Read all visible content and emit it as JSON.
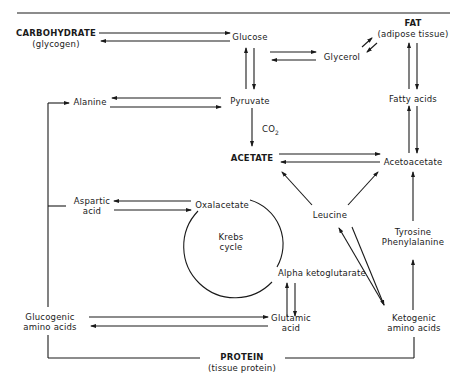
{
  "diagram": {
    "type": "metabolic-pathway",
    "nodes": {
      "carbohydrate": {
        "title": "CARBOHYDRATE",
        "subtitle": "(glycogen)"
      },
      "glucose": {
        "label": "Glucose"
      },
      "glycerol": {
        "label": "Glycerol"
      },
      "fat": {
        "title": "FAT",
        "subtitle": "(adipose tissue)"
      },
      "alanine": {
        "label": "Alanine"
      },
      "pyruvate": {
        "label": "Pyruvate"
      },
      "fatty_acids": {
        "label": "Fatty acids"
      },
      "co2": {
        "label": "CO",
        "sub": "2"
      },
      "acetate": {
        "label": "ACETATE"
      },
      "acetoacetate": {
        "label": "Acetoacetate"
      },
      "aspartic_acid": {
        "line1": "Aspartic",
        "line2": "acid"
      },
      "oxalacetate": {
        "label": "Oxalacetate"
      },
      "leucine": {
        "label": "Leucine"
      },
      "krebs_cycle": {
        "line1": "Krebs",
        "line2": "cycle"
      },
      "tyrosine_phenylalanine": {
        "line1": "Tyrosine",
        "line2": "Phenylalanine"
      },
      "alpha_ketoglutarate": {
        "label": "Alpha ketoglutarate"
      },
      "glucogenic_amino_acids": {
        "line1": "Glucogenic",
        "line2": "amino acids"
      },
      "glutamic_acid": {
        "line1": "Glutamic",
        "line2": "acid"
      },
      "ketogenic_amino_acids": {
        "line1": "Ketogenic",
        "line2": "amino acids"
      },
      "protein": {
        "title": "PROTEIN",
        "subtitle": "(tissue protein)"
      }
    },
    "edges": [
      {
        "from": "Carbohydrate",
        "to": "Glucose",
        "type": "reversible"
      },
      {
        "from": "Glucose",
        "to": "Glycerol",
        "type": "reversible"
      },
      {
        "from": "Glycerol",
        "to": "Fat",
        "type": "reversible"
      },
      {
        "from": "Glucose",
        "to": "Pyruvate",
        "type": "reversible"
      },
      {
        "from": "Fat",
        "to": "Fatty acids",
        "type": "reversible"
      },
      {
        "from": "Alanine",
        "to": "Pyruvate",
        "type": "reversible"
      },
      {
        "from": "Pyruvate",
        "to": "Acetate",
        "type": "one-way",
        "note": "CO2"
      },
      {
        "from": "Fatty acids",
        "to": "Acetoacetate",
        "type": "reversible"
      },
      {
        "from": "Acetate",
        "to": "Acetoacetate",
        "type": "reversible"
      },
      {
        "from": "Leucine",
        "to": "Acetate",
        "type": "one-way"
      },
      {
        "from": "Leucine",
        "to": "Acetoacetate",
        "type": "one-way"
      },
      {
        "from": "Aspartic acid",
        "to": "Oxalacetate",
        "type": "reversible"
      },
      {
        "from": "Tyrosine/Phenylalanine",
        "to": "Acetoacetate",
        "type": "one-way"
      },
      {
        "from": "Alpha ketoglutarate",
        "to": "Glutamic acid",
        "type": "reversible"
      },
      {
        "from": "Glucogenic amino acids",
        "to": "Glutamic acid",
        "type": "reversible"
      },
      {
        "from": "Leucine",
        "to": "Ketogenic amino acids",
        "type": "reversible"
      },
      {
        "from": "Ketogenic amino acids",
        "to": "Tyrosine/Phenylalanine",
        "type": "one-way"
      },
      {
        "from": "Protein",
        "to": "Glucogenic amino acids",
        "type": "line"
      },
      {
        "from": "Protein",
        "to": "Ketogenic amino acids",
        "type": "line"
      },
      {
        "from": "Glucogenic amino acids",
        "to": "Alanine",
        "type": "one-way"
      },
      {
        "from": "Glucogenic amino acids",
        "to": "Aspartic acid",
        "type": "line"
      }
    ]
  }
}
